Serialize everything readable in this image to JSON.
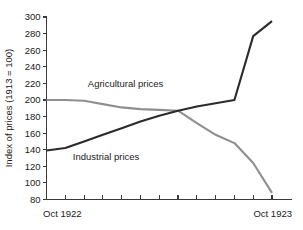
{
  "chart_data": {
    "type": "line",
    "title": "",
    "xlabel": "",
    "ylabel": "Index of prices (1913 = 100)",
    "ylim": [
      80,
      300
    ],
    "yticks": [
      80,
      100,
      120,
      140,
      160,
      180,
      200,
      220,
      240,
      260,
      280,
      300
    ],
    "ytick_labels": [
      "80",
      "100",
      "120",
      "140",
      "160",
      "180",
      "200",
      "220",
      "240",
      "260",
      "280",
      "300"
    ],
    "xlim": [
      0,
      12
    ],
    "xticks": [
      0,
      1,
      2,
      3,
      4,
      5,
      6,
      7,
      8,
      9,
      10,
      11,
      12
    ],
    "xtick_labels": [
      "Oct 1922",
      "",
      "",
      "",
      "",
      "",
      "",
      "",
      "",
      "",
      "",
      "",
      "Oct 1923"
    ],
    "x_axis_start_label": "Oct 1922",
    "x_axis_end_label": "Oct 1923",
    "grid": false,
    "legend": "inline-annotations",
    "x": [
      0,
      1,
      2,
      3,
      4,
      5,
      6,
      7,
      8,
      9,
      10,
      11,
      12
    ],
    "series": [
      {
        "name": "Agricultural prices",
        "color": "#8f8f8f",
        "values": [
          200,
          200,
          199,
          195,
          191,
          189,
          188,
          187,
          172,
          158,
          148,
          124,
          88
        ],
        "label_text": "Agricultural prices",
        "label_x": 2.2,
        "label_y": 216
      },
      {
        "name": "Industrial prices",
        "color": "#2b2b2b",
        "values": [
          139,
          142,
          150,
          158,
          166,
          174,
          181,
          187,
          192,
          196,
          200,
          277,
          295
        ],
        "label_text": "Industrial prices",
        "label_x": 1.4,
        "label_y": 128
      }
    ],
    "annotations": [
      {
        "text": "Agricultural prices",
        "series": "Agricultural prices"
      },
      {
        "text": "Industrial prices",
        "series": "Industrial prices"
      }
    ],
    "colors": {
      "agricultural": "#8f8f8f",
      "industrial": "#2b2b2b",
      "axis": "#3a3a3a",
      "background": "#ffffff"
    }
  }
}
